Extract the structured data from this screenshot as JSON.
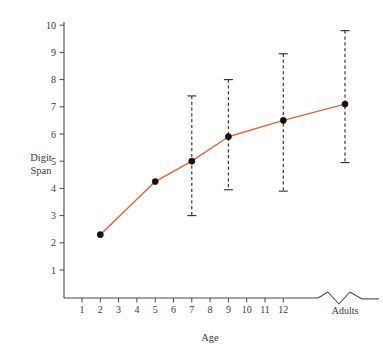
{
  "chart_data": {
    "type": "line",
    "title": "",
    "subtitle": "",
    "xlabel": "Age",
    "ylabel_line1": "Digit",
    "ylabel_line2": "Span",
    "ylabel": "Digit Span",
    "grid": false,
    "legend": false,
    "xtick_labels": [
      "1",
      "2",
      "3",
      "4",
      "5",
      "6",
      "7",
      "8",
      "9",
      "10",
      "11",
      "12",
      "Adults"
    ],
    "xtick_values": [
      1,
      2,
      3,
      4,
      5,
      6,
      7,
      8,
      9,
      10,
      11,
      12,
      14
    ],
    "ytick_labels": [
      "1",
      "2",
      "3",
      "4",
      "5",
      "6",
      "7",
      "8",
      "9",
      "10"
    ],
    "ytick_values": [
      1,
      2,
      3,
      4,
      5,
      6,
      7,
      8,
      9,
      10
    ],
    "xlim": [
      0.2,
      15.0
    ],
    "ylim": [
      0.0,
      10.6
    ],
    "axis_break": {
      "present": true,
      "between_labels": [
        "12",
        "Adults"
      ],
      "style": "zigzag"
    },
    "series": [
      {
        "name": "Digit Span",
        "color": "#E8613C",
        "marker": "filled-circle",
        "x": [
          2,
          5,
          7,
          9,
          12,
          14
        ],
        "x_labels": [
          "2",
          "5",
          "7",
          "9",
          "12",
          "Adults"
        ],
        "values": [
          2.3,
          4.25,
          5.0,
          5.9,
          6.5,
          7.1
        ],
        "error_bars": [
          {
            "x_label": "2",
            "lower": null,
            "upper": null
          },
          {
            "x_label": "5",
            "lower": null,
            "upper": null
          },
          {
            "x_label": "7",
            "lower": 3.0,
            "upper": 7.4
          },
          {
            "x_label": "9",
            "lower": 3.95,
            "upper": 8.0
          },
          {
            "x_label": "12",
            "lower": 3.9,
            "upper": 8.95
          },
          {
            "x_label": "Adults",
            "lower": 4.95,
            "upper": 9.8
          }
        ]
      }
    ],
    "colors": {
      "line": "#E8613C",
      "marker": "#111111",
      "axis": "#4a4a4a",
      "error_bar": "#2b2b2b",
      "text": "#3a3a3a",
      "background": "#ffffff"
    }
  }
}
